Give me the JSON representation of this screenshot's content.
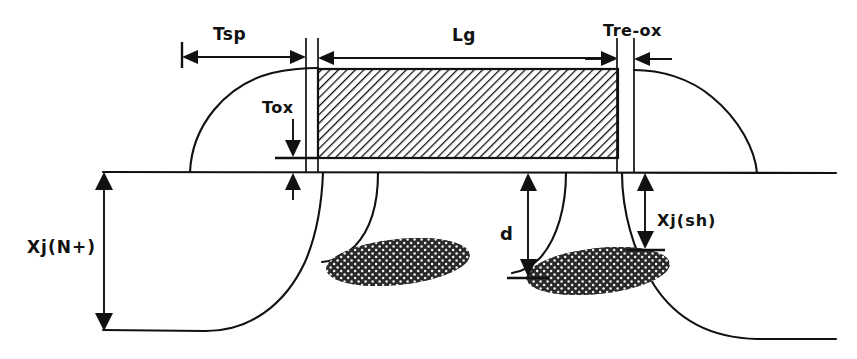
{
  "figure": {
    "background_color": "#ffffff",
    "line_color": "#111111"
  },
  "labels": {
    "spacer": "Tsp",
    "gate_length": "Lg",
    "reox": "Tre-ox",
    "gate_oxide": "Tox",
    "junction_depth_nplus": "Xj(N+)",
    "implant_depth": "d",
    "shallow_junction": "Xj(sh)"
  },
  "regions": {
    "gate": "gate-electrode",
    "field_oxide_left": "field-oxide-birdsbeak-left",
    "field_oxide_right": "field-oxide-birdsbeak-right",
    "implant_left": "pocket-implant-left",
    "implant_right": "pocket-implant-right",
    "substrate_surface": "substrate-surface-line",
    "junction_nplus": "nplus-junction-boundary"
  },
  "dimensions": {
    "tsp_label": "Tsp",
    "lg_label": "Lg",
    "treox_label": "Tre-ox",
    "tox_label": "Tox",
    "xjn_label": "Xj(N+)",
    "d_label": "d",
    "xjsh_label": "Xj(sh)"
  }
}
